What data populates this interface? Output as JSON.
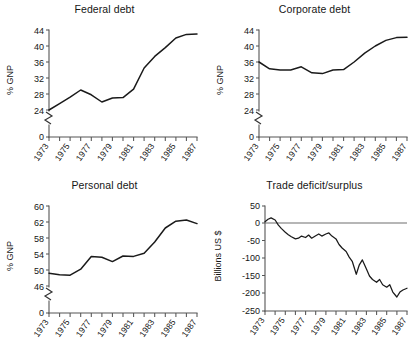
{
  "figure": {
    "panel_count": 4,
    "background_color": "#ffffff",
    "line_color": "#1a1a1a",
    "axis_color": "#555555"
  },
  "panels": {
    "federal": {
      "title": "Federal debt",
      "ylabel": "% GNP",
      "yticks": [
        "44",
        "40",
        "36",
        "32",
        "28",
        "24",
        "0"
      ],
      "xticks": [
        "1973",
        "1975",
        "1977",
        "1979",
        "1981",
        "1983",
        "1985",
        "1987"
      ]
    },
    "corporate": {
      "title": "Corporate debt",
      "ylabel": "% GNP",
      "yticks": [
        "44",
        "40",
        "36",
        "32",
        "28",
        "24",
        "0"
      ],
      "xticks": [
        "1973",
        "1975",
        "1977",
        "1979",
        "1981",
        "1983",
        "1985",
        "1987"
      ]
    },
    "personal": {
      "title": "Personal debt",
      "ylabel": "% GNP",
      "yticks": [
        "60",
        "62",
        "58",
        "54",
        "50",
        "46",
        "0"
      ],
      "xticks": [
        "1973",
        "1975",
        "1977",
        "1979",
        "1981",
        "1983",
        "1985",
        "1987"
      ]
    },
    "trade": {
      "title": "Trade deficit/surplus",
      "ylabel": "Billions US $",
      "yticks": [
        "50",
        "0",
        "-50",
        "-100",
        "-150",
        "-200",
        "-250"
      ],
      "xticks": [
        "1973",
        "1975",
        "1977",
        "1979",
        "1981",
        "1983",
        "1985",
        "1987"
      ]
    }
  },
  "chart_data": [
    {
      "type": "line",
      "title": "Federal debt",
      "xlabel": "",
      "ylabel": "% GNP",
      "ylim": [
        24,
        44
      ],
      "y_axis_break": true,
      "y_break_note": "axis broken between 0 and 24",
      "xlim": [
        1973,
        1987
      ],
      "grid": false,
      "legend": "none",
      "x": [
        1973,
        1974,
        1975,
        1976,
        1977,
        1978,
        1979,
        1980,
        1981,
        1982,
        1983,
        1984,
        1985,
        1986,
        1987
      ],
      "values": [
        24.0,
        25.6,
        27.2,
        29.0,
        27.8,
        26.0,
        27.0,
        27.1,
        29.2,
        34.5,
        37.4,
        39.6,
        42.0,
        42.9,
        43.0
      ]
    },
    {
      "type": "line",
      "title": "Corporate debt",
      "xlabel": "",
      "ylabel": "% GNP",
      "ylim": [
        24,
        44
      ],
      "y_axis_break": true,
      "y_break_note": "axis broken between 0 and 24",
      "xlim": [
        1973,
        1987
      ],
      "grid": false,
      "legend": "none",
      "x": [
        1973,
        1974,
        1975,
        1976,
        1977,
        1978,
        1979,
        1980,
        1981,
        1982,
        1983,
        1984,
        1985,
        1986,
        1987
      ],
      "values": [
        36.0,
        34.3,
        34.0,
        34.0,
        34.8,
        33.3,
        33.1,
        34.0,
        34.1,
        36.0,
        38.2,
        40.0,
        41.4,
        42.1,
        42.2
      ]
    },
    {
      "type": "line",
      "title": "Personal debt",
      "xlabel": "",
      "ylabel": "% GNP",
      "ylim": [
        46,
        62
      ],
      "y_axis_break": true,
      "y_break_note": "axis broken between 0 and 46; topmost tick printed as 60 above 62",
      "xlim": [
        1973,
        1987
      ],
      "grid": false,
      "legend": "none",
      "x": [
        1973,
        1974,
        1975,
        1976,
        1977,
        1978,
        1979,
        1980,
        1981,
        1982,
        1983,
        1984,
        1985,
        1986,
        1987
      ],
      "values": [
        49.2,
        48.8,
        48.7,
        50.2,
        53.4,
        53.2,
        52.1,
        53.5,
        53.4,
        54.2,
        57.0,
        60.5,
        62.2,
        62.5,
        61.6
      ]
    },
    {
      "type": "line",
      "title": "Trade deficit/surplus",
      "xlabel": "",
      "ylabel": "Billions US $",
      "ylim": [
        -250,
        50
      ],
      "xlim": [
        1973,
        1987
      ],
      "grid": false,
      "zero_reference_line": true,
      "legend": "none",
      "x": [
        1973.0,
        1973.3,
        1973.6,
        1974.0,
        1974.3,
        1974.6,
        1975.0,
        1975.3,
        1975.6,
        1976.0,
        1976.3,
        1976.6,
        1977.0,
        1977.3,
        1977.6,
        1978.0,
        1978.3,
        1978.6,
        1979.0,
        1979.3,
        1979.6,
        1980.0,
        1980.3,
        1980.6,
        1981.0,
        1981.3,
        1981.6,
        1982.0,
        1982.3,
        1982.6,
        1983.0,
        1983.3,
        1983.6,
        1984.0,
        1984.3,
        1984.6,
        1985.0,
        1985.3,
        1985.6,
        1986.0,
        1986.3,
        1986.6,
        1987.0
      ],
      "values": [
        5,
        12,
        16,
        10,
        -4,
        -14,
        -25,
        -32,
        -38,
        -44,
        -42,
        -36,
        -40,
        -33,
        -42,
        -35,
        -30,
        -36,
        -30,
        -27,
        -36,
        -44,
        -60,
        -70,
        -80,
        -96,
        -108,
        -145,
        -118,
        -104,
        -130,
        -150,
        -160,
        -168,
        -160,
        -175,
        -182,
        -175,
        -196,
        -210,
        -196,
        -190,
        -185
      ]
    }
  ]
}
